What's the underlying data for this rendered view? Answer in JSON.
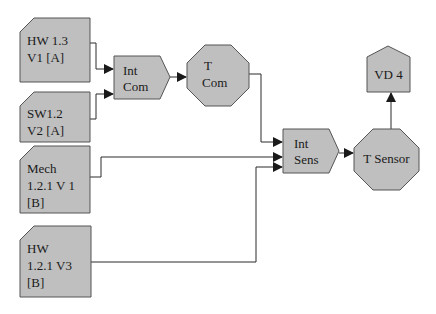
{
  "diagram": {
    "nodes": [
      {
        "id": "hw13",
        "shape": "document",
        "lines": [
          "HW 1.3",
          "V1 [A]"
        ]
      },
      {
        "id": "sw12",
        "shape": "document",
        "lines": [
          "SW1.2",
          "V2 [A]"
        ]
      },
      {
        "id": "mech121",
        "shape": "document",
        "lines": [
          "Mech",
          "1.2.1 V 1",
          "[B]"
        ]
      },
      {
        "id": "hw121",
        "shape": "document",
        "lines": [
          "HW",
          "1.2.1 V3",
          "[B]"
        ]
      },
      {
        "id": "intcom",
        "shape": "pentagon-arrow",
        "lines": [
          "Int",
          "Com"
        ]
      },
      {
        "id": "tcom",
        "shape": "octagon",
        "lines": [
          "T",
          "Com"
        ]
      },
      {
        "id": "intsens",
        "shape": "pentagon-arrow",
        "lines": [
          "Int",
          "Sens"
        ]
      },
      {
        "id": "tsensor",
        "shape": "octagon",
        "lines": [
          "T Sensor"
        ]
      },
      {
        "id": "vd4",
        "shape": "house",
        "lines": [
          "VD 4"
        ]
      }
    ],
    "edges": [
      {
        "from": "hw13",
        "to": "intcom"
      },
      {
        "from": "sw12",
        "to": "intcom"
      },
      {
        "from": "intcom",
        "to": "tcom"
      },
      {
        "from": "tcom",
        "to": "intsens"
      },
      {
        "from": "mech121",
        "to": "intsens"
      },
      {
        "from": "hw121",
        "to": "intsens"
      },
      {
        "from": "intsens",
        "to": "tsensor"
      },
      {
        "from": "tsensor",
        "to": "vd4"
      }
    ],
    "colors": {
      "fill": "#bfbfbf",
      "stroke": "#555555",
      "line": "#2a2a2a"
    }
  }
}
